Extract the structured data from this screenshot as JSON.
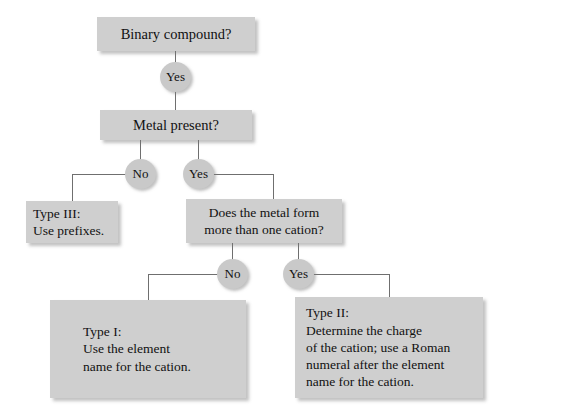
{
  "diagram": {
    "background_color": "#ffffff",
    "box_color": "#cfcfcf",
    "oval_color": "#c9c9c9",
    "line_color": "#6f6f6f",
    "text_color": "#111111"
  },
  "nodes": {
    "binary_compound": "Binary compound?",
    "metal_present": "Metal present?",
    "type3": "Type III:\nUse prefixes.",
    "more_than_one_cation": "Does the metal form\nmore than one cation?",
    "type1": "Type I:\nUse the element\nname for the cation.",
    "type2": "Type II:\nDetermine the charge\nof the cation; use a Roman\nnumeral after the element\nname for the cation."
  },
  "labels": {
    "yes1": "Yes",
    "no2": "No",
    "yes2": "Yes",
    "no3": "No",
    "yes3": "Yes"
  }
}
